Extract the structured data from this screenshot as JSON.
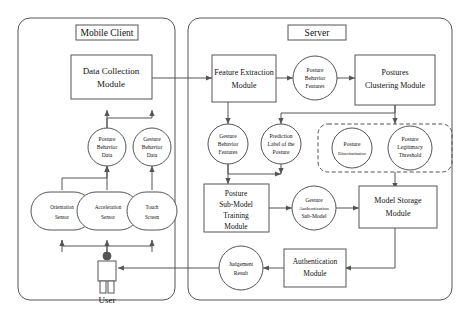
{
  "diagram": {
    "panels": [
      {
        "id": "mobile-client",
        "label": "Mobile Client"
      },
      {
        "id": "server",
        "label": "Server"
      }
    ],
    "boxes": [
      {
        "id": "data-collection-module",
        "lines": [
          "Data Collection",
          "Module"
        ]
      },
      {
        "id": "feature-extraction-module",
        "lines": [
          "Feature Extraction",
          "Module"
        ]
      },
      {
        "id": "postures-clustering-module",
        "lines": [
          "Postures",
          "Clustering Module"
        ]
      },
      {
        "id": "posture-sub-model-training-module",
        "lines": [
          "Posture",
          "Sub-Model",
          "Training",
          "Module"
        ]
      },
      {
        "id": "model-storage-module",
        "lines": [
          "Model Storage",
          "Module"
        ]
      },
      {
        "id": "authentication-module",
        "lines": [
          "Authentication",
          "Module"
        ]
      }
    ],
    "circles": [
      {
        "id": "posture-behavior-data",
        "lines": [
          "Posture",
          "Behavior",
          "Data"
        ]
      },
      {
        "id": "gesture-behavior-data",
        "lines": [
          "Gesture",
          "Behavior",
          "Data"
        ]
      },
      {
        "id": "posture-behavior-features",
        "lines": [
          "Posture",
          "Behavior",
          "Features"
        ]
      },
      {
        "id": "gesture-behavior-features",
        "lines": [
          "Gesture",
          "Behavior",
          "Features"
        ]
      },
      {
        "id": "prediction-label-of-the-posture",
        "lines": [
          "Prediction",
          "Label of the",
          "Posture"
        ]
      },
      {
        "id": "posture-discriminator",
        "lines": [
          "Posture",
          "Discriminator"
        ]
      },
      {
        "id": "posture-legitimacy-threshold",
        "lines": [
          "Posture",
          "Legitimacy",
          "Threshold"
        ]
      },
      {
        "id": "gesture-authentication-sub-model",
        "lines": [
          "Gesture",
          "Authentication",
          "Sub-Model"
        ]
      },
      {
        "id": "judgement-result",
        "lines": [
          "Judgement",
          "Result"
        ]
      }
    ],
    "sensors": [
      {
        "id": "orientation-sensor",
        "lines": [
          "Orientation",
          "Sensor"
        ]
      },
      {
        "id": "acceleration-sensor",
        "lines": [
          "Acceleration",
          "Sensor"
        ]
      },
      {
        "id": "touch-screen",
        "lines": [
          "Touch",
          "Screen"
        ]
      }
    ],
    "actor": {
      "id": "user",
      "label": "User"
    }
  },
  "colors": {
    "stroke": "#555555",
    "text": "#111111",
    "background": "#ffffff"
  }
}
